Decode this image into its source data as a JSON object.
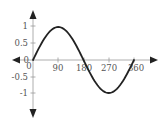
{
  "chart_data": {
    "type": "line",
    "title": "",
    "xlabel": "",
    "ylabel": "",
    "function": "y = sin(x)",
    "x": [
      0,
      30,
      60,
      90,
      120,
      150,
      180,
      210,
      240,
      270,
      300,
      330,
      360
    ],
    "series": [
      {
        "name": "sin(x)",
        "values": [
          0,
          0.5,
          0.87,
          1,
          0.87,
          0.5,
          0,
          -0.5,
          -0.87,
          -1,
          -0.87,
          -0.5,
          0
        ]
      }
    ],
    "xticks": [
      "0",
      "90",
      "180",
      "270",
      "360"
    ],
    "yticks": [
      "1",
      "0.5",
      "0",
      "-0.5",
      "-1"
    ],
    "xlim": [
      0,
      360
    ],
    "ylim": [
      -1,
      1
    ],
    "grid": false,
    "legend": null,
    "axis_arrows": [
      "up",
      "down",
      "left",
      "right"
    ]
  },
  "labels": {
    "y_1": "1",
    "y_05": "0.5",
    "y_0": "0",
    "y_m05": "-0.5",
    "y_m1": "-1",
    "x_0": "0",
    "x_90": "90",
    "x_180": "180",
    "x_270": "270",
    "x_360": "360"
  },
  "colors": {
    "axis": "#8a8a8a",
    "curve": "#222222",
    "arrow": "#222222",
    "text": "#555555"
  }
}
